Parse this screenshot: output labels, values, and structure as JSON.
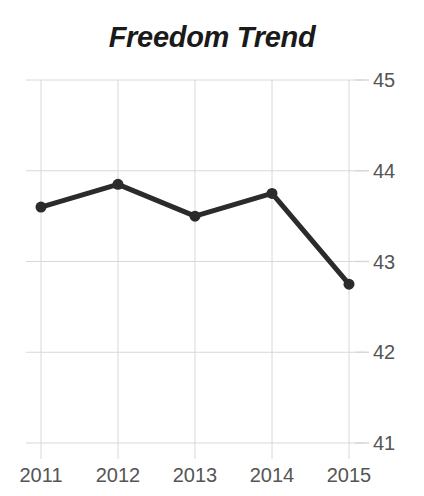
{
  "chart_data": {
    "type": "line",
    "title": "Freedom Trend",
    "subtitle": "",
    "xlabel": "",
    "ylabel": "",
    "categories": [
      "2011",
      "2012",
      "2013",
      "2014",
      "2015"
    ],
    "x": [
      2011,
      2012,
      2013,
      2014,
      2015
    ],
    "values": [
      43.6,
      43.85,
      43.5,
      43.75,
      42.75
    ],
    "series": [
      {
        "name": "Freedom Score",
        "values": [
          43.6,
          43.85,
          43.5,
          43.75,
          42.75
        ]
      }
    ],
    "ylim": [
      41,
      45
    ],
    "xlim": [
      2011,
      2015
    ],
    "y_ticks": [
      "45",
      "44",
      "43",
      "42",
      "41"
    ],
    "y_tick_values": [
      45,
      44,
      43,
      42,
      41
    ],
    "x_ticks": [
      "2011",
      "2012",
      "2013",
      "2014",
      "2015"
    ],
    "grid": true,
    "grid_axes": "both",
    "legend": false,
    "legend_position": "none",
    "markers": true,
    "marker_shape": "circle",
    "annotations": []
  },
  "style": {
    "line_color": "#2b2b2b",
    "marker_color": "#2b2b2b",
    "grid_color": "#d8d8d8",
    "title_color": "#1a1a1a",
    "tick_label_color": "#555555",
    "background_color": "#ffffff"
  },
  "axis": {
    "y_tick_label_0": "45",
    "y_tick_label_1": "44",
    "y_tick_label_2": "43",
    "y_tick_label_3": "42",
    "y_tick_label_4": "41",
    "x_tick_label_0": "2011",
    "x_tick_label_1": "2012",
    "x_tick_label_2": "2013",
    "x_tick_label_3": "2014",
    "x_tick_label_4": "2015"
  }
}
